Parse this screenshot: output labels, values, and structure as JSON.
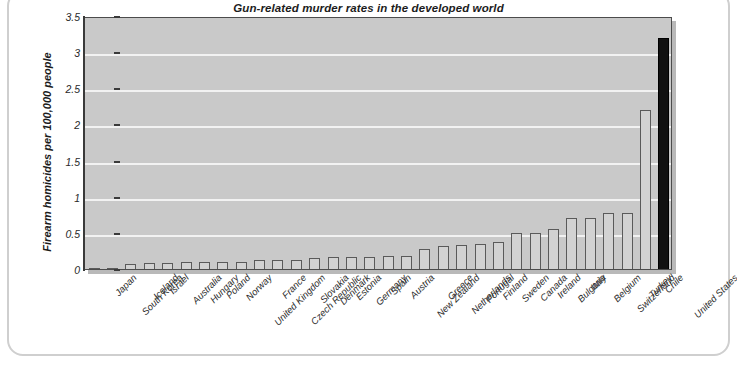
{
  "chart_data": {
    "type": "bar",
    "title": "Gun-related murder rates in the developed world",
    "xlabel": "",
    "ylabel": "Firearm homicides per 100,000 people",
    "ylim": [
      0,
      3.5
    ],
    "ytick_labels": [
      "0",
      "0.5",
      "1",
      "1.5",
      "2",
      "2.5",
      "3",
      "3.5"
    ],
    "ytick_values": [
      0,
      0.5,
      1,
      1.5,
      2,
      2.5,
      3,
      3.5
    ],
    "grid": true,
    "legend": "none",
    "highlight_category": "United States",
    "highlight_color": "#111111",
    "bar_color": "#d2d2d2",
    "plot_background": "#c9c9c9",
    "categories": [
      "Japan",
      "South Korea",
      "Iceland",
      "Israel",
      "Australia",
      "Hungary",
      "Poland",
      "Norway",
      "United Kingdom",
      "France",
      "Czech Republic",
      "Slovakia",
      "Denmark",
      "Estonia",
      "Germany",
      "Spain",
      "Austria",
      "New Zealand",
      "Greece",
      "Netherlands",
      "Portugal",
      "Finland",
      "Sweden",
      "Canada",
      "Ireland",
      "Bulgaria",
      "Italy",
      "Belgium",
      "Switzerland",
      "Turkey",
      "Chile",
      "United States"
    ],
    "values": [
      0.01,
      0.02,
      0.07,
      0.09,
      0.09,
      0.1,
      0.1,
      0.1,
      0.1,
      0.12,
      0.12,
      0.13,
      0.15,
      0.16,
      0.17,
      0.17,
      0.18,
      0.18,
      0.27,
      0.32,
      0.33,
      0.35,
      0.37,
      0.5,
      0.5,
      0.55,
      0.71,
      0.7,
      0.77,
      0.77,
      2.2,
      3.2
    ]
  }
}
